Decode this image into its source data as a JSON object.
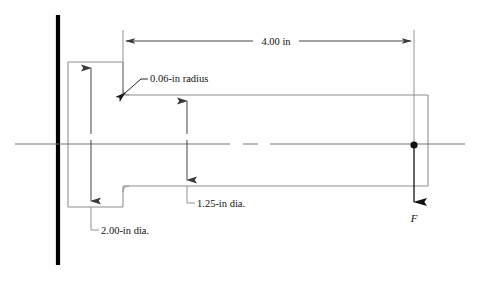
{
  "figure": {
    "kind": "engineering-drawing",
    "background_color": "#ffffff",
    "line_color": "#8a8a8a",
    "dark_line_color": "#1a1a1a",
    "wall_color": "#000000",
    "text_color": "#111111"
  },
  "annotations": {
    "length_dimension": {
      "label": "4.00 in",
      "value": 4.0,
      "unit": "in",
      "orientation": "horizontal"
    },
    "fillet_note": {
      "label": "0.06-in radius",
      "value": 0.06,
      "unit": "in"
    },
    "large_diameter": {
      "label": "2.00-in dia.",
      "value": 2.0,
      "unit": "in",
      "orientation": "vertical"
    },
    "small_diameter": {
      "label": "1.25-in dia.",
      "value": 1.25,
      "unit": "in",
      "orientation": "vertical"
    },
    "force": {
      "label": "F",
      "direction": "downward"
    }
  },
  "geometry": {
    "wall_x": 58,
    "wall_top_y": 15,
    "wall_bottom_y": 265,
    "large_shaft": {
      "left": 68,
      "right": 123,
      "top": 62,
      "bottom": 207
    },
    "small_shaft": {
      "left": 123,
      "right": 428,
      "top": 95,
      "bottom": 186
    },
    "centerline_y": 144,
    "centerline_left": 15,
    "centerline_right": 465,
    "load_point": {
      "x": 414,
      "y": 145
    }
  }
}
